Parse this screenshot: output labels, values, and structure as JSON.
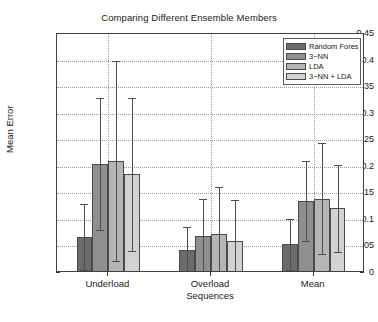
{
  "chart_data": {
    "type": "bar",
    "title": "Comparing Different Ensemble Members",
    "xlabel": "",
    "ylabel": "Mean Error",
    "ylim": [
      0,
      0.45
    ],
    "ytick_labels": [
      "0",
      "0.05",
      "0.1",
      "0.15",
      "0.2",
      "0.25",
      "0.3",
      "0.35",
      "0.4",
      "0.45"
    ],
    "ytick_values": [
      0,
      0.05,
      0.1,
      0.15,
      0.2,
      0.25,
      0.3,
      0.35,
      0.4,
      0.45
    ],
    "grid": true,
    "legend_position": "top-right",
    "categories": [
      "Underload",
      "Overload\nSequences",
      "Mean"
    ],
    "series": [
      {
        "name": "Random Forest",
        "color": "#6b6b6b",
        "values": [
          0.068,
          0.044,
          0.055
        ],
        "err_low": [
          0.005,
          0.002,
          0.006
        ],
        "err_high": [
          0.129,
          0.086,
          0.101
        ]
      },
      {
        "name": "3−NN",
        "color": "#8f8f8f",
        "values": [
          0.205,
          0.069,
          0.135
        ],
        "err_low": [
          0.081,
          0.0,
          0.06
        ],
        "err_high": [
          0.33,
          0.14,
          0.211
        ]
      },
      {
        "name": "LDA",
        "color": "#b5b5b5",
        "values": [
          0.211,
          0.073,
          0.14
        ],
        "err_low": [
          0.023,
          0.0,
          0.036
        ],
        "err_high": [
          0.399,
          0.162,
          0.245
        ]
      },
      {
        "name": "3−NN + LDA",
        "color": "#d2d2d2",
        "values": [
          0.186,
          0.06,
          0.122
        ],
        "err_low": [
          0.042,
          0.0,
          0.039
        ],
        "err_high": [
          0.33,
          0.137,
          0.203
        ]
      }
    ]
  },
  "legend": {
    "entries": [
      {
        "label": "Random Forest"
      },
      {
        "label": "3−NN"
      },
      {
        "label": "LDA"
      },
      {
        "label": "3−NN + LDA"
      }
    ]
  }
}
